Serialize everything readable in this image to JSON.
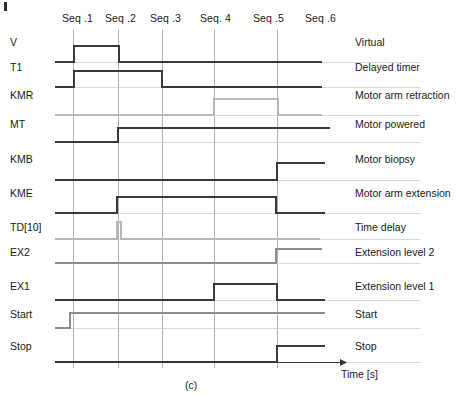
{
  "figure": {
    "caption": "(c)",
    "time_axis_label": "Time [s]",
    "corner_mark": "page-edge-mark"
  },
  "chart_data": {
    "type": "timing-diagram",
    "title": "",
    "xlabel": "Time [s]",
    "ylabel": "",
    "grid": true,
    "legend_position": "right",
    "x_range": [
      55,
      345
    ],
    "colors": {
      "dark": "#3a3a3a",
      "gray": "#8e8e8e",
      "light": "#b8b8b8",
      "gridline": "#b0b0b0",
      "axis": "#333333"
    },
    "sequences": [
      {
        "label": "Seq .1",
        "x_label": 62,
        "gridline_x": 73
      },
      {
        "label": "Seq .2",
        "x_label": 105,
        "gridline_x": 118
      },
      {
        "label": "Seq .3",
        "x_label": 150,
        "gridline_x": 162
      },
      {
        "label": "Seq. 4",
        "x_label": 200,
        "gridline_x": 214
      },
      {
        "label": "Seq .5",
        "x_label": 253,
        "gridline_x": 277
      },
      {
        "label": "Seq .6",
        "x_label": 305,
        "gridline_x": null
      }
    ],
    "signals": [
      {
        "name": "V",
        "description": "Virtual",
        "color": "dark",
        "baseline_y": 62,
        "high_y": 46,
        "label_y": 43,
        "transitions": [
          {
            "x": 55,
            "level": 0
          },
          {
            "x": 74,
            "level": 1
          },
          {
            "x": 119,
            "level": 0
          },
          {
            "x": 322,
            "level": 0
          }
        ]
      },
      {
        "name": "T1",
        "description": "Delayed timer",
        "color": "dark",
        "baseline_y": 87,
        "high_y": 71,
        "label_y": 68,
        "transitions": [
          {
            "x": 55,
            "level": 0
          },
          {
            "x": 74,
            "level": 1
          },
          {
            "x": 162,
            "level": 0
          },
          {
            "x": 322,
            "level": 0
          }
        ]
      },
      {
        "name": "KMR",
        "description": "Motor arm retraction",
        "color": "light",
        "baseline_y": 115,
        "high_y": 99,
        "label_y": 96,
        "transitions": [
          {
            "x": 55,
            "level": 0
          },
          {
            "x": 214,
            "level": 1
          },
          {
            "x": 278,
            "level": 0
          },
          {
            "x": 322,
            "level": 0
          }
        ]
      },
      {
        "name": "MT",
        "description": "Motor powered",
        "color": "dark",
        "baseline_y": 142,
        "high_y": 128,
        "label_y": 125,
        "transitions": [
          {
            "x": 55,
            "level": 0
          },
          {
            "x": 118,
            "level": 1
          },
          {
            "x": 330,
            "level": 1
          }
        ]
      },
      {
        "name": "KMB",
        "description": "Motor biopsy",
        "color": "dark",
        "baseline_y": 180,
        "high_y": 163,
        "label_y": 160,
        "transitions": [
          {
            "x": 55,
            "level": 0
          },
          {
            "x": 277,
            "level": 1
          },
          {
            "x": 325,
            "level": 1
          }
        ]
      },
      {
        "name": "KME",
        "description": "Motor arm extension",
        "color": "dark",
        "baseline_y": 213,
        "high_y": 197,
        "label_y": 194,
        "transitions": [
          {
            "x": 55,
            "level": 0
          },
          {
            "x": 117,
            "level": 1
          },
          {
            "x": 276,
            "level": 0
          },
          {
            "x": 325,
            "level": 0
          }
        ]
      },
      {
        "name": "TD[10]",
        "description": "Time delay",
        "color": "light",
        "baseline_y": 239,
        "high_y": 222,
        "label_y": 228,
        "transitions": [
          {
            "x": 55,
            "level": 0
          },
          {
            "x": 117,
            "level": 1
          },
          {
            "x": 121,
            "level": 0
          },
          {
            "x": 320,
            "level": 0
          }
        ]
      },
      {
        "name": "EX2",
        "description": "Extension level 2",
        "color": "gray",
        "baseline_y": 263,
        "high_y": 249,
        "label_y": 253,
        "transitions": [
          {
            "x": 55,
            "level": 0
          },
          {
            "x": 276,
            "level": 1
          },
          {
            "x": 322,
            "level": 1
          }
        ]
      },
      {
        "name": "EX1",
        "description": "Extension level 1",
        "color": "dark",
        "baseline_y": 300,
        "high_y": 284,
        "label_y": 287,
        "transitions": [
          {
            "x": 55,
            "level": 0
          },
          {
            "x": 214,
            "level": 1
          },
          {
            "x": 277,
            "level": 0
          },
          {
            "x": 325,
            "level": 0
          }
        ]
      },
      {
        "name": "Start",
        "description": "Start",
        "color": "gray",
        "baseline_y": 328,
        "high_y": 313,
        "label_y": 315,
        "transitions": [
          {
            "x": 55,
            "level": 0
          },
          {
            "x": 70,
            "level": 1
          },
          {
            "x": 325,
            "level": 1
          }
        ]
      },
      {
        "name": "Stop",
        "description": "Stop",
        "color": "dark",
        "baseline_y": 362,
        "high_y": 346,
        "label_y": 347,
        "transitions": [
          {
            "x": 55,
            "level": 0
          },
          {
            "x": 277,
            "level": 1
          },
          {
            "x": 325,
            "level": 1
          }
        ]
      }
    ],
    "gridline_top": 30,
    "gridline_bottom": 368,
    "time_axis": {
      "y": 362,
      "x_start": 55,
      "x_end": 347
    }
  }
}
